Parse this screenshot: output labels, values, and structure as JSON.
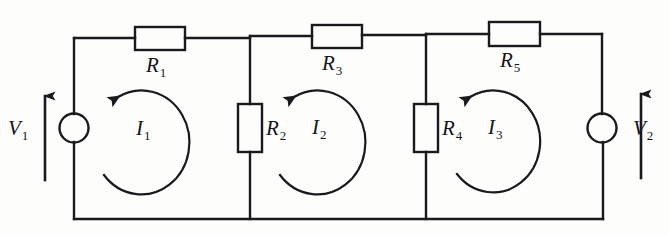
{
  "figure": {
    "type": "circuit-schematic",
    "background_color": "#fdfdfc",
    "line_color": "#1a1a1e"
  },
  "components": {
    "resistors": [
      {
        "id": "R1",
        "label": "R",
        "subscript": "1",
        "orientation": "horizontal",
        "position": "top-left-branch"
      },
      {
        "id": "R2",
        "label": "R",
        "subscript": "2",
        "orientation": "vertical",
        "position": "first-shunt-branch"
      },
      {
        "id": "R3",
        "label": "R",
        "subscript": "3",
        "orientation": "horizontal",
        "position": "top-middle-branch"
      },
      {
        "id": "R4",
        "label": "R",
        "subscript": "4",
        "orientation": "vertical",
        "position": "second-shunt-branch"
      },
      {
        "id": "R5",
        "label": "R",
        "subscript": "5",
        "orientation": "horizontal",
        "position": "top-right-branch"
      }
    ],
    "sources": [
      {
        "id": "V1",
        "label": "V",
        "subscript": "1",
        "symbol": "circle",
        "position": "left-branch",
        "arrow_direction": "up"
      },
      {
        "id": "V2",
        "label": "V",
        "subscript": "2",
        "symbol": "circle",
        "position": "right-branch",
        "arrow_direction": "up"
      }
    ],
    "mesh_currents": [
      {
        "id": "I1",
        "label": "I",
        "subscript": "1",
        "direction": "counterclockwise",
        "mesh": "left"
      },
      {
        "id": "I2",
        "label": "I",
        "subscript": "2",
        "direction": "counterclockwise",
        "mesh": "middle"
      },
      {
        "id": "I3",
        "label": "I",
        "subscript": "3",
        "direction": "counterclockwise",
        "mesh": "right"
      }
    ]
  }
}
